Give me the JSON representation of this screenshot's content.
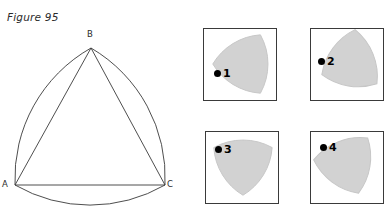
{
  "caption": "Figure 95",
  "main_figure": {
    "name": "reuleaux-triangle-construction",
    "vertices": [
      {
        "label": "A",
        "x": 15,
        "y": 163
      },
      {
        "label": "B",
        "x": 91,
        "y": 26
      },
      {
        "label": "C",
        "x": 165,
        "y": 163
      }
    ],
    "stroke_color": "#2b2b2b"
  },
  "panels": [
    {
      "number": "1",
      "rotation_deg": 0,
      "orientation": "vertex-left"
    },
    {
      "number": "2",
      "rotation_deg": -22,
      "orientation": "vertex-left-up"
    },
    {
      "number": "3",
      "rotation_deg": -90,
      "orientation": "vertex-down"
    },
    {
      "number": "4",
      "rotation_deg": -112,
      "orientation": "vertex-down-left"
    }
  ],
  "colors": {
    "shape_fill": "#d2d2d2",
    "shape_stroke": "#c2c2c2",
    "panel_border": "#3a3a3a",
    "ink": "#2b2b2b",
    "background": "#ffffff"
  }
}
